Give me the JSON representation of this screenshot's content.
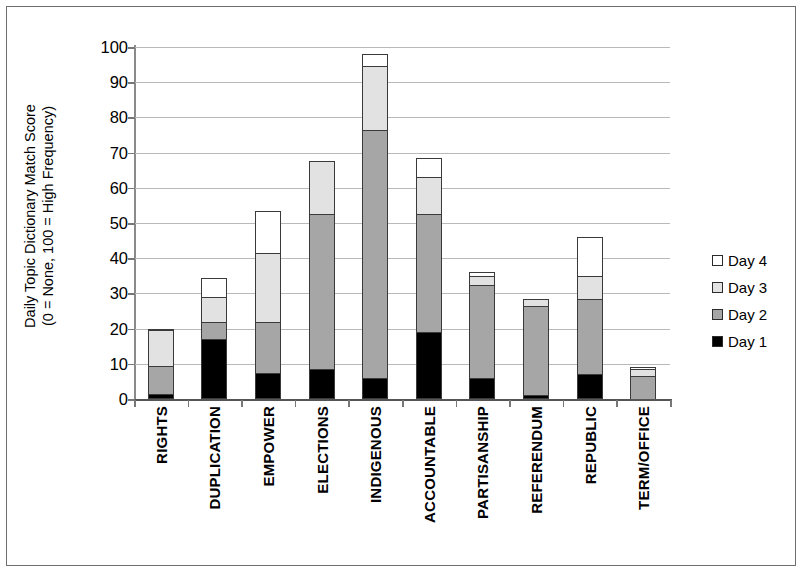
{
  "chart_data": {
    "type": "bar",
    "subtype": "stacked-vertical-bar",
    "title": "",
    "xlabel": "",
    "ylabel": "Daily Topic Dictionary Match Score (0 = None, 100 = High Frequency)",
    "ylabel_line1": "Daily Topic Dictionary Match Score",
    "ylabel_line2": "(0 = None, 100 = High Frequency)",
    "ylim": [
      0,
      100
    ],
    "ytick_step": 10,
    "yticks": [
      100,
      90,
      80,
      70,
      60,
      50,
      40,
      30,
      20,
      10,
      0
    ],
    "grid": "horizontal",
    "legend_position": "right",
    "stack_order_bottom_to_top": [
      "Day 1",
      "Day 2",
      "Day 3",
      "Day 4"
    ],
    "categories": [
      "RIGHTS",
      "DUPLICATION",
      "EMPOWER",
      "ELECTIONS",
      "INDIGENOUS",
      "ACCOUNTABLE",
      "PARTISANSHIP",
      "REFERENDUM",
      "REPUBLIC",
      "TERM/OFFICE"
    ],
    "series": [
      {
        "name": "Day 1",
        "color": "#000000",
        "values": [
          1.5,
          17,
          7.5,
          8.5,
          6,
          19,
          6,
          1,
          7,
          0
        ]
      },
      {
        "name": "Day 2",
        "color": "#a6a6a6",
        "values": [
          8,
          5,
          14.5,
          44,
          70.5,
          33.5,
          26.5,
          25.5,
          21.5,
          6.5
        ]
      },
      {
        "name": "Day 3",
        "color": "#e2e2e2",
        "values": [
          10,
          7,
          19.5,
          15,
          18,
          10.5,
          2.5,
          2,
          6.5,
          2
        ]
      },
      {
        "name": "Day 4",
        "color": "#ffffff",
        "values": [
          0.5,
          5.5,
          12,
          0,
          3.5,
          5.5,
          1,
          0,
          11,
          0.5
        ]
      }
    ],
    "totals": [
      20,
      34.5,
      53.5,
      67.5,
      98,
      68.5,
      36,
      28.5,
      46,
      9
    ]
  },
  "legend": {
    "items": [
      {
        "label": "Day 4",
        "color": "#ffffff"
      },
      {
        "label": "Day 3",
        "color": "#e2e2e2"
      },
      {
        "label": "Day 2",
        "color": "#a6a6a6"
      },
      {
        "label": "Day 1",
        "color": "#000000"
      }
    ]
  }
}
